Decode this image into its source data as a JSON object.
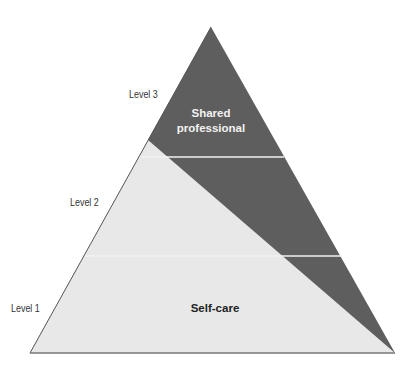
{
  "diagram": {
    "type": "pyramid",
    "levels": [
      {
        "label": "Level 3",
        "position": "top"
      },
      {
        "label": "Level 2",
        "position": "middle"
      },
      {
        "label": "Level 1",
        "position": "bottom"
      }
    ],
    "regions": {
      "dark": {
        "label_line1": "Shared",
        "label_line2": "professional",
        "color": "#5e5e5e"
      },
      "light": {
        "label": "Self-care",
        "color": "#e8e8e8"
      }
    },
    "divider_color": "#ffffff",
    "outline_color": "#666666"
  }
}
